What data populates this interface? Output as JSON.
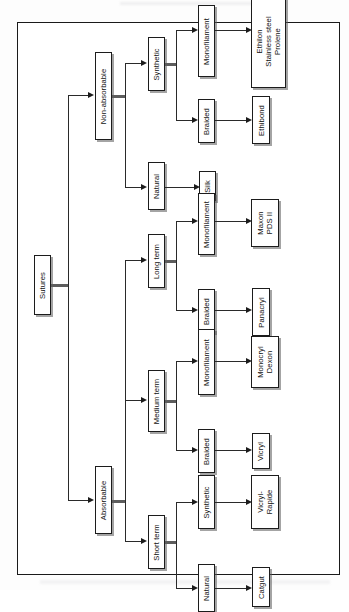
{
  "figure": {
    "orientation": "rotated-90-ccw",
    "frame": {
      "border_color": "#1a1a1a"
    },
    "box_fill": "#ffffff",
    "line_color": "#2a2a2a"
  },
  "nodes": {
    "root": "Sutures",
    "level2": {
      "non_absorbable": "Non-absorbable",
      "absorbable": "Absorbable"
    },
    "level3": {
      "natural_na": "Natural",
      "synthetic_na": "Synthetic",
      "long_term": "Long term",
      "medium_term": "Medium term",
      "short_term": "Short term"
    },
    "level4": {
      "braided_syn": "Braided",
      "monofilament_syn": "Monofilament",
      "braided_long": "Braided",
      "monofilament_long": "Monofilament",
      "braided_medium": "Braided",
      "monofilament_medium": "Monofilament",
      "natural_short": "Natural",
      "synthetic_short": "Synthetic"
    },
    "level5": {
      "silk": "Silk",
      "ethibond": "Ethibond",
      "ethilon_group": "Ethilon\nStainless steel\nProlene",
      "panacryl": "Panacryl",
      "maxon_pds": "Maxon\nPDS II",
      "vicryl": "Vicryl",
      "monocryl_dexon": "Monocryl\nDexon",
      "catgut": "Catgut",
      "vicryl_rapide": "Vicryl-\nRapide"
    }
  }
}
